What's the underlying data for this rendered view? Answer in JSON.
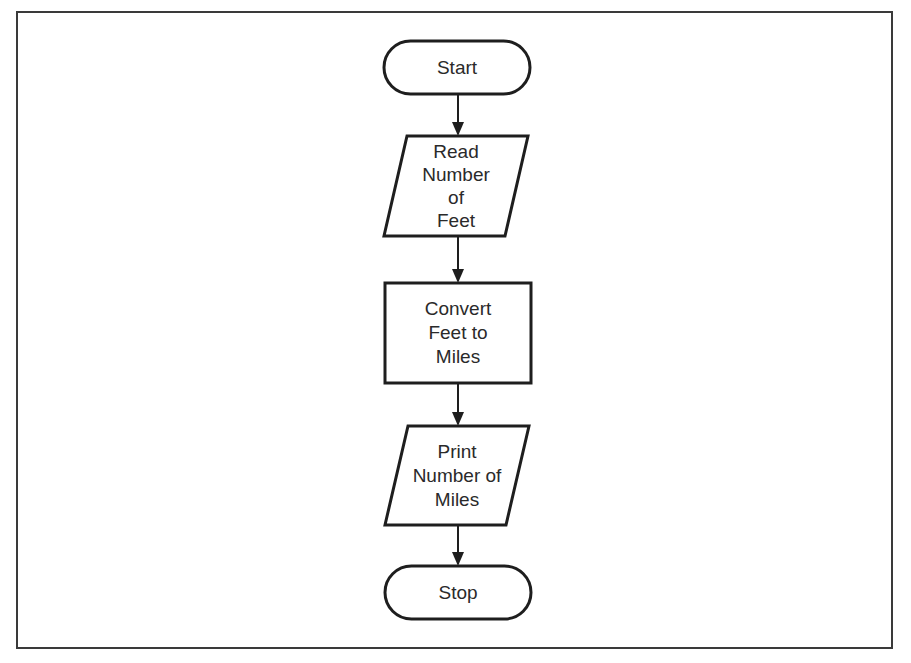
{
  "diagram": {
    "type": "flowchart",
    "nodes": [
      {
        "id": "start",
        "shape": "terminal",
        "lines": [
          "Start"
        ]
      },
      {
        "id": "read",
        "shape": "parallelogram",
        "lines": [
          "Read",
          "Number",
          "of",
          "Feet"
        ]
      },
      {
        "id": "convert",
        "shape": "rectangle",
        "lines": [
          "Convert",
          "Feet to",
          "Miles"
        ]
      },
      {
        "id": "print",
        "shape": "parallelogram",
        "lines": [
          "Print",
          "Number of",
          "Miles"
        ]
      },
      {
        "id": "stop",
        "shape": "terminal",
        "lines": [
          "Stop"
        ]
      }
    ],
    "edges": [
      {
        "from": "start",
        "to": "read"
      },
      {
        "from": "read",
        "to": "convert"
      },
      {
        "from": "convert",
        "to": "print"
      },
      {
        "from": "print",
        "to": "stop"
      }
    ],
    "colors": {
      "stroke": "#1e1e1e",
      "text": "#2a2a2a",
      "background": "#ffffff",
      "frame": "#3a3a3a"
    }
  }
}
